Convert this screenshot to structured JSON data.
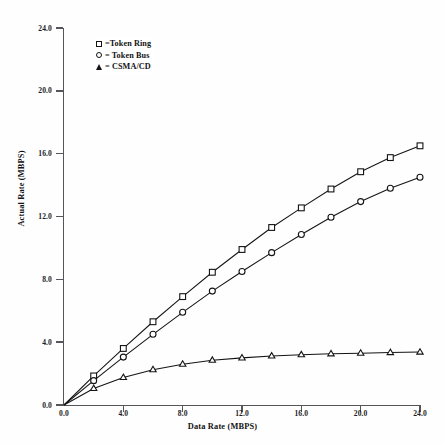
{
  "chart_data": {
    "type": "line",
    "title": "",
    "xlabel": "Data Rate (MBPS)",
    "ylabel": "Actual Rate (MBPS)",
    "xlim": [
      0.0,
      24.0
    ],
    "ylim": [
      0.0,
      24.0
    ],
    "xticks": [
      "0.0",
      "4.0",
      "8.0",
      "12.0",
      "16.0",
      "20.0",
      "24.0"
    ],
    "yticks": [
      "0.0",
      "4.0",
      "8.0",
      "12.0",
      "16.0",
      "20.0",
      "24.0"
    ],
    "xtick_values": [
      0,
      4,
      8,
      12,
      16,
      20,
      24
    ],
    "ytick_values": [
      0,
      4,
      8,
      12,
      16,
      20,
      24
    ],
    "grid": false,
    "legend_position": "upper-left-inside",
    "x": [
      0,
      2,
      4,
      6,
      8,
      10,
      12,
      14,
      16,
      18,
      20,
      22,
      24
    ],
    "series": [
      {
        "name": "Token Ring",
        "marker": "square",
        "legend_label": "=Token Ring",
        "values": [
          0.0,
          1.85,
          3.6,
          5.3,
          6.9,
          8.45,
          9.9,
          11.3,
          12.55,
          13.75,
          14.85,
          15.75,
          16.5
        ]
      },
      {
        "name": "Token Bus",
        "marker": "circle",
        "legend_label": "= Token Bus",
        "values": [
          0.0,
          1.55,
          3.05,
          4.5,
          5.9,
          7.25,
          8.5,
          9.7,
          10.85,
          11.95,
          12.95,
          13.8,
          14.5
        ]
      },
      {
        "name": "CSMA/CD",
        "marker": "triangle",
        "legend_label": "= CSMA/CD",
        "values": [
          0.0,
          1.05,
          1.75,
          2.25,
          2.6,
          2.85,
          3.0,
          3.12,
          3.2,
          3.26,
          3.3,
          3.34,
          3.37
        ]
      }
    ]
  },
  "legend": {
    "items": [
      {
        "label": "=Token Ring",
        "marker": "square-marker"
      },
      {
        "label": "= Token Bus",
        "marker": "circle-marker"
      },
      {
        "label": "= CSMA/CD",
        "marker": "triangle-marker"
      }
    ]
  },
  "colors": {
    "line": "#141416",
    "axis": "#55565a",
    "text": "#131315",
    "background": "#ffffff"
  }
}
